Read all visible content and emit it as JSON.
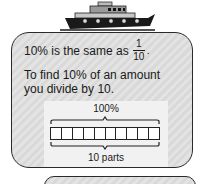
{
  "illustration": {
    "icon": "ship-icon"
  },
  "card": {
    "line1_text": "10% is the same as",
    "fraction": {
      "numerator": "1",
      "denominator": "10"
    },
    "line1_end": ".",
    "line2": "To find 10% of an amount",
    "line3": "you divide by 10."
  },
  "diagram": {
    "top_label": "100%",
    "bottom_label": "10 parts",
    "cells": 10
  }
}
